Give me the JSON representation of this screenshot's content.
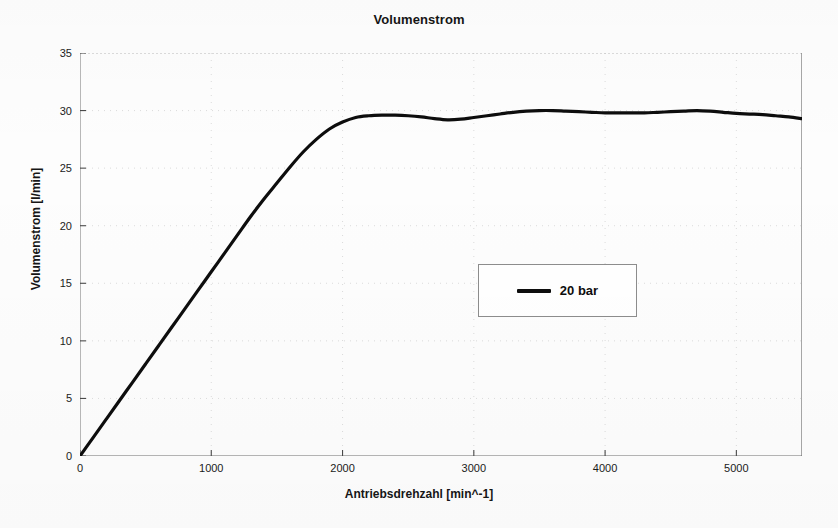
{
  "chart_data": {
    "type": "line",
    "title": "Volumenstrom",
    "xlabel": "Antriebsdrehzahl [min^-1]",
    "ylabel": "Volumenstrom [l/min]",
    "xlim": [
      0,
      5500
    ],
    "ylim": [
      0,
      35
    ],
    "xticks": [
      0,
      1000,
      2000,
      3000,
      4000,
      5000
    ],
    "xtick_labels": [
      "0",
      "1000",
      "2000",
      "3000",
      "4000",
      "5000"
    ],
    "yticks": [
      0,
      5,
      10,
      15,
      20,
      25,
      30,
      35
    ],
    "ytick_labels": [
      "0",
      "5",
      "10",
      "15",
      "20",
      "25",
      "30",
      "35"
    ],
    "grid": true,
    "grid_style": "faint-dotted",
    "legend_position": "center",
    "line_color": "#0d0d0d",
    "line_width": 3.2,
    "series": [
      {
        "name": "20 bar",
        "x": [
          0,
          100,
          200,
          300,
          400,
          500,
          600,
          700,
          800,
          900,
          1000,
          1100,
          1200,
          1300,
          1400,
          1500,
          1600,
          1700,
          1800,
          1900,
          2000,
          2100,
          2200,
          2300,
          2400,
          2500,
          2600,
          2700,
          2800,
          2900,
          3000,
          3100,
          3200,
          3300,
          3400,
          3500,
          3600,
          3700,
          3800,
          3900,
          4000,
          4100,
          4200,
          4300,
          4400,
          4500,
          4600,
          4700,
          4800,
          4900,
          5000,
          5100,
          5200,
          5300,
          5400,
          5500
        ],
        "y": [
          0.0,
          1.6,
          3.2,
          4.8,
          6.4,
          8.0,
          9.6,
          11.2,
          12.8,
          14.4,
          16.0,
          17.6,
          19.2,
          20.8,
          22.3,
          23.7,
          25.1,
          26.4,
          27.5,
          28.4,
          29.0,
          29.4,
          29.55,
          29.6,
          29.6,
          29.55,
          29.45,
          29.3,
          29.2,
          29.25,
          29.4,
          29.55,
          29.7,
          29.85,
          29.95,
          30.0,
          30.0,
          29.95,
          29.9,
          29.85,
          29.8,
          29.8,
          29.8,
          29.8,
          29.85,
          29.9,
          29.95,
          30.0,
          29.95,
          29.85,
          29.75,
          29.7,
          29.65,
          29.55,
          29.45,
          29.3
        ]
      }
    ]
  },
  "legend": {
    "entries": [
      {
        "label": "20 bar",
        "color": "#0d0d0d"
      }
    ]
  }
}
